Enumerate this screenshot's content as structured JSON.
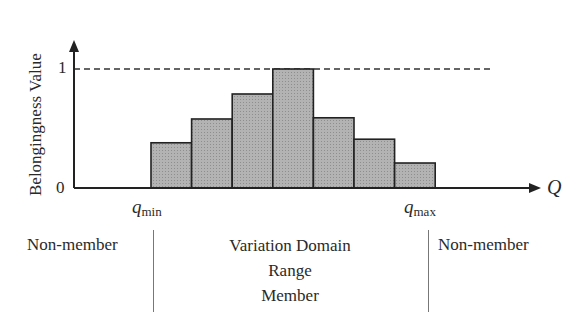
{
  "chart_data": {
    "type": "bar",
    "title": "",
    "xlabel": "Q",
    "ylabel": "Belongingness Value",
    "ylim": [
      0,
      1
    ],
    "yticks": [
      "0",
      "1"
    ],
    "reference_line": {
      "y": 1,
      "style": "dashed"
    },
    "x_markers": [
      "q_min",
      "q_max"
    ],
    "categories": [
      "b1",
      "b2",
      "b3",
      "b4",
      "b5",
      "b6",
      "b7"
    ],
    "values": [
      0.38,
      0.58,
      0.79,
      1.0,
      0.59,
      0.41,
      0.21
    ],
    "bar_color": "#a9a9a9",
    "grid": false
  },
  "axis": {
    "y_title": "Belongingness Value",
    "y_tick_0": "0",
    "y_tick_1": "1",
    "x_title": "Q",
    "q_min_base": "q",
    "q_min_sub": "min",
    "q_max_base": "q",
    "q_max_sub": "max"
  },
  "regions": {
    "left": "Non-member",
    "center_line1": "Variation Domain",
    "center_line2": "Range",
    "center_line3": "Member",
    "right": "Non-member"
  }
}
